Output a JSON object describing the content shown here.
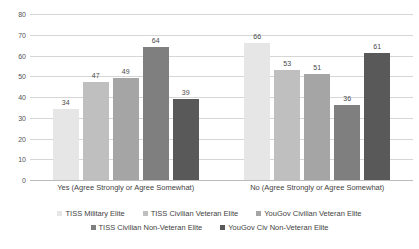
{
  "chart_data": {
    "type": "bar",
    "title": "Chart",
    "xlabel": "",
    "ylabel": "",
    "ylim": [
      0,
      80
    ],
    "yticks": [
      0,
      10,
      20,
      30,
      40,
      50,
      60,
      70,
      80
    ],
    "ytick_labels": [
      "0",
      "10",
      "20",
      "30",
      "40",
      "50",
      "60",
      "70",
      "80"
    ],
    "grid": true,
    "legend_position": "bottom",
    "data_labels": true,
    "categories": [
      "Yes (Agree Strongly or Agree Somewhat)",
      "No (Agree Strongly or Agree Somewhat)"
    ],
    "series": [
      {
        "name": "TISS Military Elite",
        "color": "#e6e6e6",
        "values": [
          34,
          66
        ]
      },
      {
        "name": "TISS Civilian Veteran Elite",
        "color": "#bfbfbf",
        "values": [
          47,
          53
        ]
      },
      {
        "name": "YouGov Civilian Veteran Elite",
        "color": "#a5a5a5",
        "values": [
          49,
          51
        ]
      },
      {
        "name": "TISS Civilian Non-Veteran Elite",
        "color": "#7f7f7f",
        "values": [
          64,
          36
        ]
      },
      {
        "name": "YouGov Civ Non-Veteran Elite",
        "color": "#595959",
        "values": [
          39,
          61
        ]
      }
    ]
  },
  "colors": {
    "background": "#ffffff",
    "gridline": "#d6d6d6",
    "baseline": "#bcbcbc",
    "text": "#3f3f3f",
    "tick_text": "#555555"
  }
}
